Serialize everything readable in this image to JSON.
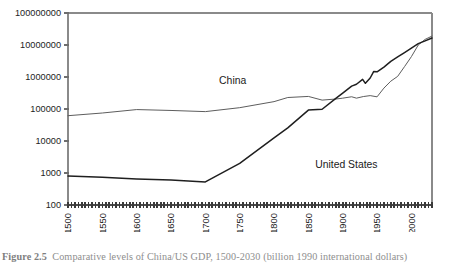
{
  "figure": {
    "caption_prefix": "Figure 2.5",
    "caption_body": "Comparative levels of China/US GDP, 1500-2030 (billion 1990 international dollars)"
  },
  "labels": {
    "china": "China",
    "united_states": "United States"
  },
  "chart_data": {
    "type": "line",
    "title": "",
    "xlabel": "",
    "ylabel": "",
    "scale": "log-y",
    "grid": false,
    "legend_position": "inline-annotation",
    "xlim": [
      1500,
      2030
    ],
    "ylim": [
      100,
      100000000
    ],
    "xtick_labels": [
      "1500",
      "1550",
      "1600",
      "1650",
      "1700",
      "1750",
      "1800",
      "1850",
      "1900",
      "1950",
      "2000"
    ],
    "xticks": [
      1500,
      1550,
      1600,
      1650,
      1700,
      1750,
      1800,
      1850,
      1900,
      1950,
      2000
    ],
    "ytick_labels": [
      "100",
      "1000",
      "10000",
      "100000",
      "1000000",
      "10000000",
      "100000000"
    ],
    "yticks": [
      100,
      1000,
      10000,
      100000,
      1000000,
      10000000,
      100000000
    ],
    "colors": {
      "china": "#5d5d5d",
      "united_states": "#1f1f1f",
      "axis": "#8a8a8a",
      "background": "#ffffff"
    },
    "series": [
      {
        "name": "China",
        "color": "#5d5d5d",
        "x": [
          1500,
          1550,
          1600,
          1650,
          1700,
          1750,
          1800,
          1820,
          1850,
          1870,
          1890,
          1900,
          1913,
          1920,
          1930,
          1940,
          1950,
          1960,
          1970,
          1980,
          1990,
          2000,
          2010,
          2020,
          2030
        ],
        "values": [
          61800,
          75000,
          96000,
          90000,
          82800,
          110000,
          170000,
          228600,
          247000,
          189740,
          205000,
          218154,
          241344,
          218000,
          245000,
          262000,
          239903,
          450000,
          740000,
          1046000,
          2109400,
          4330000,
          10000000,
          15000000,
          19000000
        ]
      },
      {
        "name": "United States",
        "color": "#1f1f1f",
        "x": [
          1500,
          1550,
          1600,
          1650,
          1700,
          1750,
          1800,
          1820,
          1850,
          1870,
          1890,
          1900,
          1913,
          1920,
          1929,
          1933,
          1940,
          1945,
          1950,
          1960,
          1970,
          1980,
          1990,
          2000,
          2010,
          2020,
          2030
        ],
        "values": [
          800,
          730,
          650,
          600,
          527,
          2000,
          12548,
          25700,
          92600,
          98374,
          214000,
          312499,
          517383,
          593438,
          843334,
          635000,
          930828,
          1474900,
          1455916,
          2046727,
          3081900,
          4230558,
          5803200,
          8030900,
          11000000,
          13500000,
          16500000
        ]
      }
    ],
    "annotations": [
      {
        "text": "China",
        "x": 1720,
        "y": 620000
      },
      {
        "text": "United States",
        "x": 1860,
        "y": 1400
      }
    ]
  }
}
